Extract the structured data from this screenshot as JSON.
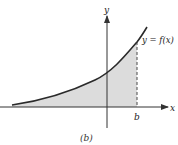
{
  "figure": {
    "caption": "(b)",
    "curve_label": "y = f(x)",
    "x_axis_label": "x",
    "y_axis_label": "y",
    "bound_label": "b",
    "colors": {
      "curve": "#2a2a2a",
      "axes": "#333333",
      "shade": "#dcdcdc",
      "dashed": "#666666"
    }
  }
}
